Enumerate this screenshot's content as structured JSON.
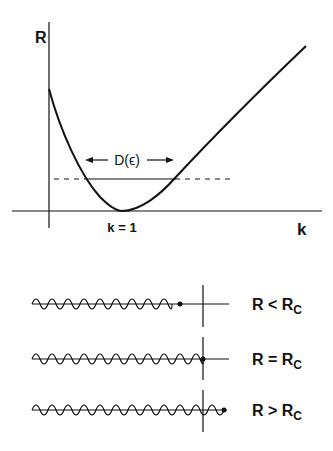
{
  "top_plot": {
    "y_axis_label": "R",
    "x_axis_label": "k",
    "minimum_label": "k = 1",
    "width_label_prefix": "D(",
    "width_label_symbol": "ϵ",
    "width_label_suffix": ")",
    "curve": "R(k) with minimum at k = 1",
    "threshold_line": "dashed horizontal line, solid between curve intersections"
  },
  "bottom_rows": [
    {
      "label_main": "R < R",
      "label_sub": "C",
      "description": "wave ends before barrier"
    },
    {
      "label_main": "R = R",
      "label_sub": "C",
      "description": "wave ends at barrier"
    },
    {
      "label_main": "R > R",
      "label_sub": "C",
      "description": "wave passes barrier"
    }
  ],
  "colors": {
    "ink": "#111111",
    "background": "#ffffff"
  }
}
